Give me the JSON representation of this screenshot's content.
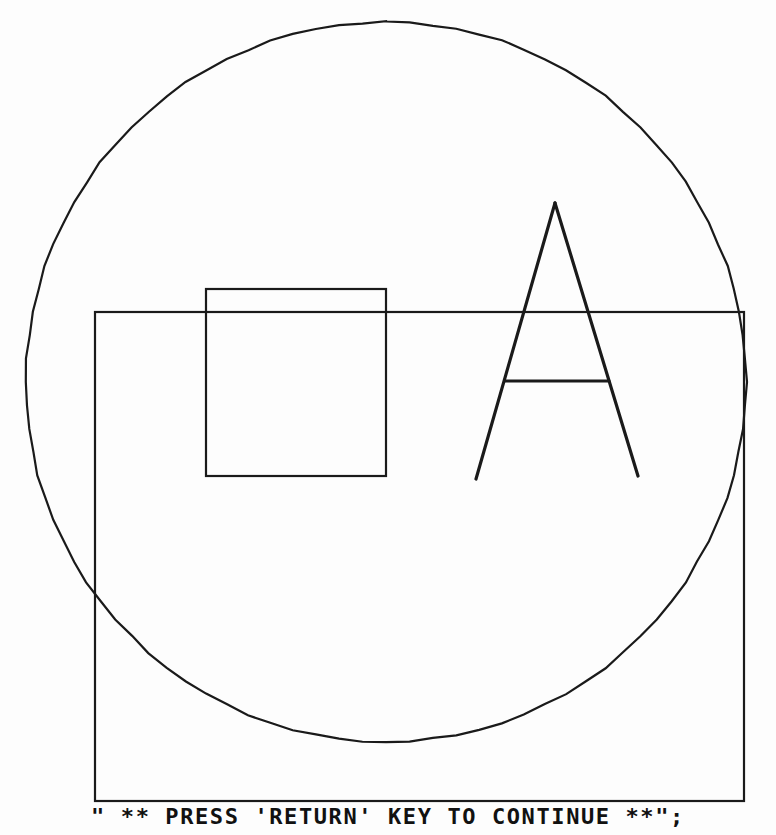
{
  "screen": {
    "width": 776,
    "height": 835,
    "background_color": "#fdfdfd",
    "ink_color": "#1a1a1a"
  },
  "prompt": {
    "text": "\" ** PRESS 'RETURN' KEY TO CONTINUE **\";",
    "label": "press-return-prompt"
  },
  "graphics": {
    "title": "Vector graphics demo output",
    "stroke_color": "#1a1a1a",
    "shapes": [
      {
        "name": "circle",
        "type": "circle",
        "cx": 386,
        "cy": 382,
        "r": 360,
        "stroke_width": 2.2
      },
      {
        "name": "outer-rectangle",
        "type": "rect",
        "x": 95,
        "y": 312,
        "width": 649,
        "height": 489,
        "stroke_width": 2.2
      },
      {
        "name": "inner-square",
        "type": "rect",
        "x": 206,
        "y": 289,
        "width": 180,
        "height": 187,
        "stroke_width": 2.2
      },
      {
        "name": "letter-a-left-stroke",
        "type": "line",
        "x1": 555,
        "y1": 203,
        "x2": 476,
        "y2": 479,
        "stroke_width": 3.2
      },
      {
        "name": "letter-a-right-stroke",
        "type": "line",
        "x1": 555,
        "y1": 203,
        "x2": 638,
        "y2": 476,
        "stroke_width": 3.2
      },
      {
        "name": "letter-a-crossbar",
        "type": "line",
        "x1": 505,
        "y1": 381,
        "x2": 609,
        "y2": 381,
        "stroke_width": 3.0
      }
    ],
    "letter_drawn": "A"
  }
}
